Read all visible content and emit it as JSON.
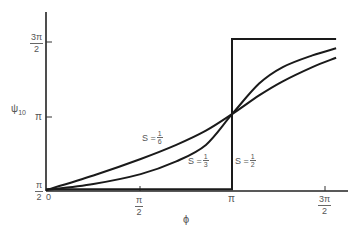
{
  "chart_data": {
    "type": "line",
    "title": "",
    "xlabel": "ϕ",
    "ylabel": "ψ10",
    "xlim": [
      0,
      4.9
    ],
    "ylim": [
      1.5708,
      4.95
    ],
    "grid": false,
    "legend": "inline labels on curves",
    "x_ticks": [
      {
        "value": 0,
        "label": "0"
      },
      {
        "value": 1.5708,
        "label_num": "π",
        "label_den": "2"
      },
      {
        "value": 3.1416,
        "label": "π"
      },
      {
        "value": 4.7124,
        "label_num": "3π",
        "label_den": "2"
      }
    ],
    "y_ticks": [
      {
        "value": 1.5708,
        "label_num": "π",
        "label_den": "2"
      },
      {
        "value": 3.1416,
        "label": "π"
      },
      {
        "value": 4.7124,
        "label_num": "3π",
        "label_den": "2"
      }
    ],
    "series": [
      {
        "name": "S = 1/2",
        "label_s": "S =",
        "label_num": "1",
        "label_den": "2",
        "shape": "step",
        "x": [
          0,
          3.1416,
          3.1416,
          4.9
        ],
        "y": [
          1.61,
          1.61,
          4.8,
          4.8
        ]
      },
      {
        "name": "S = 1/3",
        "label_s": "S =",
        "label_num": "1",
        "label_den": "3",
        "x": [
          0,
          0.8,
          1.6,
          2.2,
          2.7,
          3.1416,
          3.6,
          4.0,
          4.5,
          4.9
        ],
        "y": [
          1.59,
          1.72,
          1.93,
          2.2,
          2.55,
          3.2,
          3.85,
          4.2,
          4.45,
          4.6
        ]
      },
      {
        "name": "S = 1/6",
        "label_s": "S =",
        "label_num": "1",
        "label_den": "6",
        "x": [
          0,
          0.8,
          1.6,
          2.2,
          2.7,
          3.1416,
          3.6,
          4.0,
          4.5,
          4.9
        ],
        "y": [
          1.59,
          1.9,
          2.25,
          2.55,
          2.85,
          3.2,
          3.6,
          3.9,
          4.2,
          4.4
        ]
      }
    ]
  },
  "axes": {
    "xlabel": "ϕ",
    "ylabel_main": "ψ",
    "ylabel_sub": "10"
  }
}
